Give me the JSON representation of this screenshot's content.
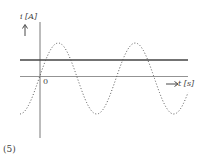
{
  "figure": {
    "y_axis_label": "i [A]",
    "x_axis_label": "t [s]",
    "origin_label": "0",
    "caption": "(5)"
  },
  "curves": {
    "constant_line": {
      "style": "solid",
      "color": "#555555"
    },
    "sinusoid": {
      "style": "dotted",
      "color": "#555555"
    }
  },
  "chart_data": {
    "type": "line",
    "title": "",
    "xlabel": "t [s]",
    "ylabel": "i [A]",
    "grid": false,
    "series": [
      {
        "name": "DC current (constant)",
        "style": "solid",
        "description": "horizontal line above t-axis"
      },
      {
        "name": "AC current (sinusoid)",
        "style": "dotted",
        "description": "sine wave through origin, amplitude larger than DC level, ~2 periods shown"
      }
    ]
  }
}
